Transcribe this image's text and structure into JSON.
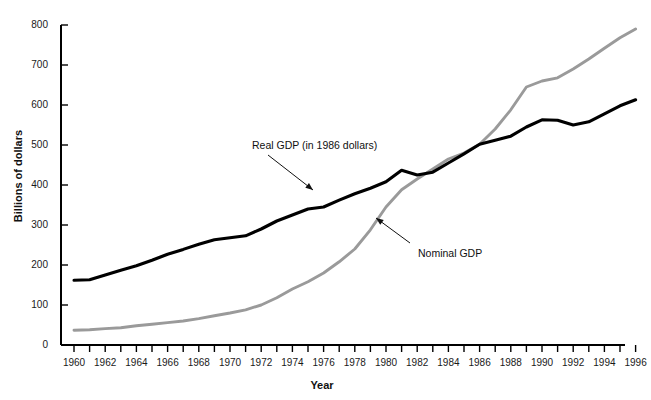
{
  "chart_data": {
    "type": "line",
    "title": "",
    "xlabel": "Year",
    "ylabel": "Billions of dollars",
    "xlim": [
      1959,
      1997
    ],
    "ylim": [
      0,
      800
    ],
    "grid": false,
    "legend_position": "inline-annotations",
    "x": [
      1960,
      1961,
      1962,
      1963,
      1964,
      1965,
      1966,
      1967,
      1968,
      1969,
      1970,
      1971,
      1972,
      1973,
      1974,
      1975,
      1976,
      1977,
      1978,
      1979,
      1980,
      1981,
      1982,
      1983,
      1984,
      1985,
      1986,
      1987,
      1988,
      1989,
      1990,
      1991,
      1992,
      1993,
      1994,
      1995,
      1996
    ],
    "xtick_labels": [
      "1960",
      "1962",
      "1964",
      "1966",
      "1968",
      "1970",
      "1972",
      "1974",
      "1976",
      "1978",
      "1980",
      "1982",
      "1984",
      "1986",
      "1988",
      "1990",
      "1992",
      "1994",
      "1996"
    ],
    "ytick_labels": [
      "0",
      "100",
      "200",
      "300",
      "400",
      "500",
      "600",
      "700",
      "800"
    ],
    "ytick_values": [
      0,
      100,
      200,
      300,
      400,
      500,
      600,
      700,
      800
    ],
    "series": [
      {
        "name": "Real GDP (in 1986 dollars)",
        "color": "#000000",
        "values": [
          162,
          163,
          175,
          187,
          198,
          212,
          227,
          239,
          252,
          263,
          268,
          273,
          290,
          310,
          325,
          340,
          345,
          362,
          378,
          392,
          408,
          437,
          425,
          432,
          455,
          478,
          502,
          512,
          522,
          545,
          563,
          562,
          550,
          558,
          578,
          598,
          613
        ]
      },
      {
        "name": "Nominal GDP",
        "color": "#9a9a9a",
        "values": [
          37,
          38,
          41,
          43,
          48,
          52,
          56,
          60,
          66,
          73,
          80,
          88,
          100,
          118,
          140,
          158,
          180,
          208,
          240,
          288,
          345,
          388,
          415,
          440,
          465,
          480,
          502,
          540,
          588,
          645,
          660,
          668,
          690,
          715,
          742,
          768,
          790
        ]
      }
    ],
    "annotations": [
      {
        "text": "Real GDP (in 1986 dollars)",
        "target_series": "Real GDP (in 1986 dollars)",
        "arrow": "down-right"
      },
      {
        "text": "Nominal GDP",
        "target_series": "Nominal GDP",
        "arrow": "up-left"
      }
    ]
  }
}
